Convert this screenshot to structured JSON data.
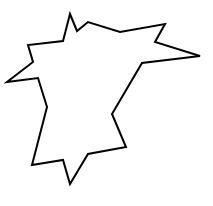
{
  "canvas": {
    "width": 213,
    "height": 206,
    "background": "#ffffff"
  },
  "shape": {
    "type": "polygon",
    "stroke": "#000000",
    "stroke_width": 2,
    "fill": "none",
    "points": [
      [
        70,
        14
      ],
      [
        77,
        31
      ],
      [
        88,
        22
      ],
      [
        120,
        32
      ],
      [
        165,
        24
      ],
      [
        155,
        42
      ],
      [
        200,
        56
      ],
      [
        142,
        63
      ],
      [
        112,
        114
      ],
      [
        126,
        147
      ],
      [
        88,
        154
      ],
      [
        70,
        184
      ],
      [
        63,
        160
      ],
      [
        32,
        165
      ],
      [
        47,
        107
      ],
      [
        38,
        78
      ],
      [
        7,
        82
      ],
      [
        33,
        62
      ],
      [
        28,
        45
      ],
      [
        63,
        41
      ]
    ]
  }
}
